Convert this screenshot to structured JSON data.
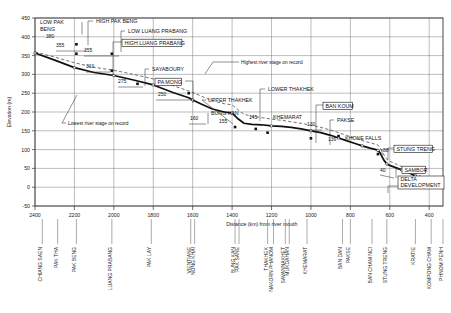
{
  "figure": {
    "name": "mekong-river-longitudinal-profile"
  },
  "axes": {
    "y_label": "Elevation (m)",
    "x_label": "Distance (km) from river mouth",
    "y_ticks": [
      "450",
      "400",
      "350",
      "300",
      "250",
      "200",
      "150",
      "100",
      "50",
      "0",
      "-50"
    ],
    "x_ticks": [
      "2400",
      "2200",
      "2000",
      "1800",
      "1600",
      "1400",
      "1200",
      "1000",
      "800",
      "600",
      "400"
    ]
  },
  "stations": [
    {
      "label": "CHIANG SAEN",
      "km": 2363
    },
    {
      "label": "PAK THA",
      "km": 2285
    },
    {
      "label": "PAK BENG",
      "km": 2190
    },
    {
      "label": "LUANG PRABANG",
      "km": 2010
    },
    {
      "label": "PAK LAY",
      "km": 1810
    },
    {
      "label": "VIENTIANE",
      "km": 1610
    },
    {
      "label": "NONG KHAI",
      "km": 1590
    },
    {
      "label": "BUNG KAN",
      "km": 1385
    },
    {
      "label": "PAK SANE",
      "km": 1365
    },
    {
      "label": "THAKHEK",
      "km": 1220
    },
    {
      "label": "NAKORN PHANOM",
      "km": 1190
    },
    {
      "label": "SAVANNAKHET",
      "km": 1130
    },
    {
      "label": "MUKDAHAN",
      "km": 1110
    },
    {
      "label": "KHEMARAT",
      "km": 1020
    },
    {
      "label": "BAN DAN",
      "km": 840
    },
    {
      "label": "PAKSE",
      "km": 800
    },
    {
      "label": "BAN CHAM NCI",
      "km": 690
    },
    {
      "label": "STUNG TRENG",
      "km": 615
    },
    {
      "label": "KRATIE",
      "km": 470
    },
    {
      "label": "KOMPONG CHAM",
      "km": 390
    },
    {
      "label": "PHNOM PENH",
      "km": 330
    }
  ],
  "annotations": {
    "lowest_stage": "Lowest river stage on record",
    "highest_stage": "Highest river stage on record"
  },
  "projects": [
    {
      "name": "LOW PAK BENG",
      "value": "380",
      "boxed": false
    },
    {
      "name": "HIGH PAK BENG",
      "value": "355",
      "boxed": false
    },
    {
      "name": "LOW LUANG PRABANG",
      "value": "355",
      "boxed": false
    },
    {
      "name": "HIGH LUANG PRABANG",
      "value": "310",
      "boxed": true
    },
    {
      "name": "SAYABOURY",
      "value": "275",
      "boxed": false
    },
    {
      "name": "PA MONG",
      "value": "250",
      "boxed": true
    },
    {
      "name": "BUNG KAN",
      "value": "160",
      "boxed": false
    },
    {
      "name": "UPPER THAKHEK",
      "value": "155",
      "boxed": false
    },
    {
      "name": "LOWER THAKHEK",
      "value": "145",
      "boxed": false
    },
    {
      "name": "KHEMARAT",
      "value": "130",
      "boxed": false
    },
    {
      "name": "BAN KOUM",
      "value": "136",
      "boxed": true
    },
    {
      "name": "PAKSE",
      "value": "",
      "boxed": false
    },
    {
      "name": "KHONE FALLS",
      "value": "88",
      "boxed": false
    },
    {
      "name": "STUNG TRENG",
      "value": "",
      "boxed": true
    },
    {
      "name": "SAMBOR",
      "value": "40",
      "boxed": true
    },
    {
      "name": "DELTA DEVELOPMENT",
      "value": "",
      "boxed": true
    }
  ],
  "chart_data": {
    "type": "line",
    "title": "",
    "xlabel": "Distance (km) from river mouth",
    "ylabel": "Elevation (m)",
    "xlim": [
      2400,
      330
    ],
    "ylim": [
      -50,
      450
    ],
    "x_reversed": true,
    "grid": true,
    "legend": "none",
    "series": [
      {
        "name": "Lowest river stage on record (riverbed profile)",
        "style": "solid-thick",
        "x": [
          2400,
          2300,
          2200,
          2100,
          2000,
          1900,
          1800,
          1700,
          1620,
          1600,
          1560,
          1500,
          1440,
          1400,
          1370,
          1340,
          1300,
          1250,
          1200,
          1150,
          1100,
          1050,
          1000,
          950,
          900,
          860,
          820,
          780,
          740,
          700,
          670,
          660,
          650,
          630,
          615,
          600,
          570,
          540,
          500,
          470,
          440,
          410,
          380,
          350,
          330
        ],
        "y": [
          357,
          338,
          318,
          305,
          297,
          285,
          272,
          252,
          238,
          232,
          222,
          208,
          200,
          197,
          182,
          170,
          167,
          166,
          163,
          162,
          159,
          155,
          150,
          145,
          138,
          131,
          124,
          117,
          110,
          104,
          100,
          98,
          92,
          72,
          62,
          58,
          52,
          46,
          38,
          30,
          22,
          14,
          8,
          5,
          4
        ]
      },
      {
        "name": "Highest river stage on record",
        "style": "dashed",
        "x": [
          2400,
          2300,
          2200,
          2100,
          2000,
          1900,
          1800,
          1700,
          1620,
          1600,
          1560,
          1500,
          1440,
          1400,
          1370,
          1340,
          1300,
          1250,
          1200,
          1150,
          1100,
          1050,
          1000,
          950,
          900,
          860,
          820,
          780,
          740,
          700,
          670,
          660,
          650,
          630,
          615,
          600,
          570,
          540,
          500,
          470,
          440,
          410,
          380,
          350,
          330
        ],
        "y": [
          360,
          346,
          331,
          319,
          311,
          300,
          288,
          270,
          256,
          252,
          243,
          230,
          222,
          219,
          206,
          194,
          189,
          185,
          181,
          178,
          174,
          170,
          165,
          159,
          152,
          145,
          138,
          131,
          124,
          118,
          114,
          112,
          106,
          86,
          74,
          69,
          62,
          55,
          46,
          37,
          28,
          19,
          12,
          8,
          6
        ]
      }
    ],
    "project_markers": [
      {
        "label": "LOW PAK BENG",
        "x": 2190,
        "y": 380
      },
      {
        "label": "HIGH PAK BENG",
        "x": 2190,
        "y": 355
      },
      {
        "label": "LOW LUANG PRABANG",
        "x": 2010,
        "y": 355
      },
      {
        "label": "HIGH LUANG PRABANG",
        "x": 2010,
        "y": 310
      },
      {
        "label": "SAYABOURY",
        "x": 1880,
        "y": 275
      },
      {
        "label": "PA MONG",
        "x": 1620,
        "y": 250
      },
      {
        "label": "BUNG KAN",
        "x": 1385,
        "y": 160
      },
      {
        "label": "UPPER THAKHEK",
        "x": 1280,
        "y": 155
      },
      {
        "label": "LOWER THAKHEK",
        "x": 1220,
        "y": 145
      },
      {
        "label": "KHEMARAT",
        "x": 1000,
        "y": 130
      },
      {
        "label": "BAN KOUM",
        "x": 860,
        "y": 136
      },
      {
        "label": "KHONE FALLS",
        "x": 660,
        "y": 88
      },
      {
        "label": "SAMBOR",
        "x": 470,
        "y": 40
      }
    ]
  }
}
